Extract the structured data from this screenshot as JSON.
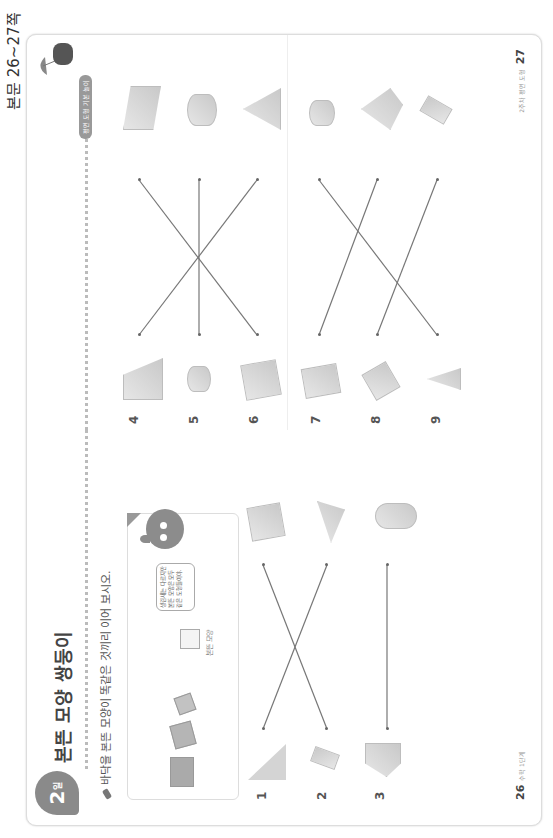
{
  "side_label": "본문 26~27쪽",
  "left_page": {
    "day_badge": {
      "number": "2",
      "suffix": "일"
    },
    "title": "본뜬 모양 쌍둥이",
    "instruction": "바닥을 본뜬 모양이 똑같은 것끼리 이어 보시오.",
    "example": {
      "square_caption": "본뜬 모양",
      "speech_bubble": "생김새는 다르지만 본뜬 모양은 모두 같은 도형들이야."
    },
    "problems": [
      {
        "number": "1",
        "left_shape": "cone",
        "right_shape": "cube"
      },
      {
        "number": "2",
        "left_shape": "rectangular-prism",
        "right_shape": "triangular-pyramid"
      },
      {
        "number": "3",
        "left_shape": "square-pyramid",
        "right_shape": "cylinder"
      }
    ],
    "matches": [
      [
        0,
        1
      ],
      [
        1,
        0
      ],
      [
        2,
        2
      ]
    ],
    "page_number": "26",
    "footer_text": "수학 1단계"
  },
  "right_page": {
    "tag": "평면 도형 기본 놀이",
    "problems": [
      {
        "number": "4",
        "left_shape": "triangular-prism",
        "right_shape": "triangular-prism"
      },
      {
        "number": "5",
        "left_shape": "cylinder",
        "right_shape": "cylinder"
      },
      {
        "number": "6",
        "left_shape": "cube",
        "right_shape": "triangular-pyramid"
      },
      {
        "number": "7",
        "left_shape": "rectangular-prism",
        "right_shape": "cylinder"
      },
      {
        "number": "8",
        "left_shape": "rectangular-prism",
        "right_shape": "square-pyramid"
      },
      {
        "number": "9",
        "left_shape": "cone",
        "right_shape": "rectangular-prism"
      }
    ],
    "matches_top": [
      [
        0,
        2
      ],
      [
        1,
        1
      ],
      [
        2,
        0
      ]
    ],
    "matches_bottom": [
      [
        0,
        1
      ],
      [
        1,
        2
      ],
      [
        2,
        0
      ]
    ],
    "page_number": "27",
    "footer_text": "2주차 평면 도형"
  }
}
